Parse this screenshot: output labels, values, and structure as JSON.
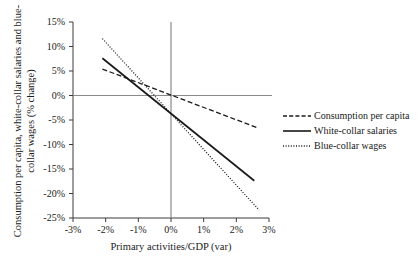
{
  "chart_data": {
    "type": "line",
    "title": "",
    "xlabel": "Primary activities/GDP (var)",
    "ylabel": "Consumption per capita, white-collar salaries and blue-collar wages (% change)",
    "xlim": [
      -3,
      3
    ],
    "ylim": [
      -25,
      15
    ],
    "xticks": [
      "-3%",
      "-2%",
      "-1%",
      "0%",
      "1%",
      "2%",
      "3%"
    ],
    "xtick_values": [
      -3,
      -2,
      -1,
      0,
      1,
      2,
      3
    ],
    "yticks": [
      "15%",
      "10%",
      "5%",
      "0%",
      "-5%",
      "-10%",
      "-15%",
      "-20%",
      "-25%"
    ],
    "ytick_values": [
      15,
      10,
      5,
      0,
      -5,
      -10,
      -15,
      -20,
      -25
    ],
    "grid": false,
    "zero_lines": {
      "horizontal_y": 0,
      "vertical_x": 0
    },
    "legend_position": "right",
    "series": [
      {
        "name": "Consumption per capita",
        "style": "dashed",
        "color": "#1a1a1a",
        "x": [
          -2.1,
          2.65
        ],
        "y": [
          5.4,
          -6.6
        ]
      },
      {
        "name": "White-collar salaries",
        "style": "solid",
        "color": "#1a1a1a",
        "x": [
          -2.1,
          2.55
        ],
        "y": [
          7.6,
          -17.4
        ]
      },
      {
        "name": "Blue-collar wages",
        "style": "dotted",
        "color": "#1a1a1a",
        "x": [
          -2.1,
          2.7
        ],
        "y": [
          11.6,
          -23.4
        ]
      }
    ]
  },
  "axis_titles": {
    "y": "Consumption per capita, white-collar salaries and blue-collar wages (% change)",
    "x": "Primary activities/GDP (var)"
  },
  "legend": {
    "items": [
      {
        "label": "Consumption per capita",
        "style": "dashed"
      },
      {
        "label": "White-collar salaries",
        "style": "solid"
      },
      {
        "label": "Blue-collar wages",
        "style": "dotted"
      }
    ]
  },
  "colors": {
    "line": "#1a1a1a",
    "axis": "#3a3a3a",
    "zero_line": "#8a8a8a",
    "background": "#ffffff"
  }
}
